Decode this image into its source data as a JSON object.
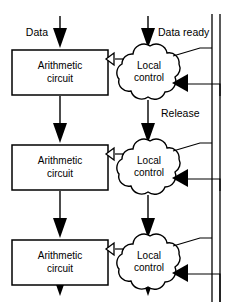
{
  "diagram": {
    "type": "block-diagram",
    "width": 229,
    "height": 302,
    "background_color": "#ffffff",
    "line_color": "#000000",
    "labels": {
      "data_input": "Data",
      "data_ready_input": "Data ready",
      "release": "Release"
    },
    "stages": [
      {
        "id": "stage-1",
        "datapath_label_line1": "Arithmetic",
        "datapath_label_line2": "circuit",
        "control_label_line1": "Local",
        "control_label_line2": "control"
      },
      {
        "id": "stage-2",
        "datapath_label_line1": "Arithmetic",
        "datapath_label_line2": "circuit",
        "control_label_line1": "Local",
        "control_label_line2": "control"
      },
      {
        "id": "stage-3",
        "datapath_label_line1": "Arithmetic",
        "datapath_label_line2": "circuit",
        "control_label_line1": "Local",
        "control_label_line2": "control"
      }
    ]
  }
}
